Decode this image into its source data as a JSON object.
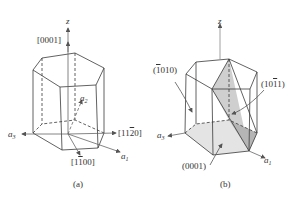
{
  "figure": {
    "panels": [
      {
        "id": "a",
        "caption": "(a)",
        "labels": {
          "z_axis": "z",
          "c_direction": "[0001]",
          "a2_axis": "a",
          "a2_sub": "2",
          "a3_axis": "a",
          "a3_sub": "3",
          "a1_axis": "a",
          "a1_sub": "1",
          "dir_1120_pre": "[11",
          "dir_1120_bar": "2",
          "dir_1120_post": "0]",
          "dir_1100_pre": "[1",
          "dir_1100_bar": "1",
          "dir_1100_post": "00]"
        }
      },
      {
        "id": "b",
        "caption": "(b)",
        "labels": {
          "z_axis": "z",
          "plane_1010_open": "(",
          "plane_1010_bar": "1",
          "plane_1010_post": "010)",
          "plane_1011_pre": "(10",
          "plane_1011_bar": "1",
          "plane_1011_post": "1)",
          "plane_0001": "(0001)",
          "a3_axis": "a",
          "a3_sub": "3",
          "a1_axis": "a",
          "a1_sub": "1"
        }
      }
    ],
    "colors": {
      "line": "#3a3a3a",
      "shade_light": "#e4e4e4",
      "shade_mid": "#cfcfcf",
      "shade_dark": "#b5b5b5"
    }
  }
}
